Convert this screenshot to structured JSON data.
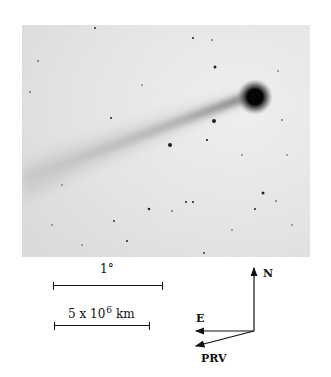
{
  "figure": {
    "photo": {
      "subject": "comet with long dust tail in star field (inverted negative)",
      "background_color": "#e9e9e9",
      "nucleus_color": "#0a0a0a"
    },
    "scale_bars": [
      {
        "label": "1°",
        "length_px": 108
      },
      {
        "label_base": "5 x 10",
        "label_exp": "6",
        "label_unit": "km",
        "length_px": 95
      }
    ],
    "compass": {
      "north_label": "N",
      "east_label": "E",
      "prv_label": "PRV"
    }
  }
}
